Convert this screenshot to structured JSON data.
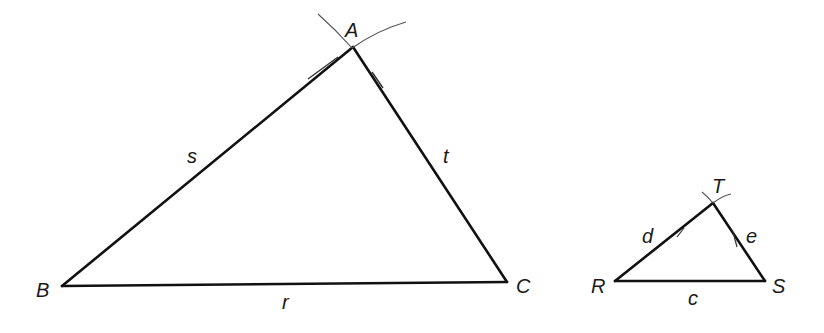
{
  "diagram": {
    "type": "geometric-construction",
    "colors": {
      "stroke": "#111111",
      "arc": "#555555",
      "label": "#1a1a1a",
      "background": "#ffffff"
    },
    "large_triangle": {
      "vertices": {
        "A": {
          "label": "A",
          "x": 353,
          "y": 47
        },
        "B": {
          "label": "B",
          "x": 62,
          "y": 286
        },
        "C": {
          "label": "C",
          "x": 507,
          "y": 282
        }
      },
      "sides": {
        "s": {
          "label": "s",
          "from": "B",
          "to": "A"
        },
        "t": {
          "label": "t",
          "from": "A",
          "to": "C"
        },
        "r": {
          "label": "r",
          "from": "B",
          "to": "C"
        }
      }
    },
    "small_triangle": {
      "vertices": {
        "T": {
          "label": "T",
          "x": 713,
          "y": 203
        },
        "R": {
          "label": "R",
          "x": 615,
          "y": 281
        },
        "S": {
          "label": "S",
          "x": 765,
          "y": 281
        }
      },
      "sides": {
        "d": {
          "label": "d",
          "from": "R",
          "to": "T"
        },
        "e": {
          "label": "e",
          "from": "T",
          "to": "S"
        },
        "c": {
          "label": "c",
          "from": "R",
          "to": "S"
        }
      }
    }
  }
}
